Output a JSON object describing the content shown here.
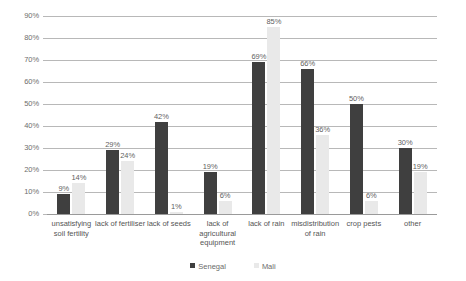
{
  "chart_data": {
    "type": "bar",
    "title": "",
    "subtitle": "",
    "xlabel": "",
    "ylabel": "",
    "ylim": [
      0,
      90
    ],
    "ytick_labels": [
      "90%",
      "80%",
      "70%",
      "60%",
      "50%",
      "40%",
      "30%",
      "20%",
      "10%",
      "0%"
    ],
    "ytick_values": [
      90,
      80,
      70,
      60,
      50,
      40,
      30,
      20,
      10,
      0
    ],
    "grid": true,
    "legend_position": "bottom-center",
    "value_labels": true,
    "value_label_suffix": "%",
    "categories": [
      "unsatisfying\nsoil fertility",
      "lack of fertiliser",
      "lack of seeds",
      "lack of\nagricultural\nequipment",
      "lack of rain",
      "misdistribution\nof rain",
      "crop pests",
      "other"
    ],
    "series": [
      {
        "name": "Senegal",
        "color": "#3f3f3f",
        "values": [
          9,
          29,
          42,
          19,
          69,
          66,
          50,
          30
        ],
        "labels": [
          "9%",
          "29%",
          "42%",
          "19%",
          "69%",
          "66%",
          "50%",
          "30%"
        ]
      },
      {
        "name": "Mali",
        "color": "#e9e9e9",
        "values": [
          14,
          24,
          1,
          6,
          85,
          36,
          6,
          19
        ],
        "labels": [
          "14%",
          "24%",
          "1%",
          "6%",
          "85%",
          "36%",
          "6%",
          "19%"
        ]
      }
    ]
  }
}
